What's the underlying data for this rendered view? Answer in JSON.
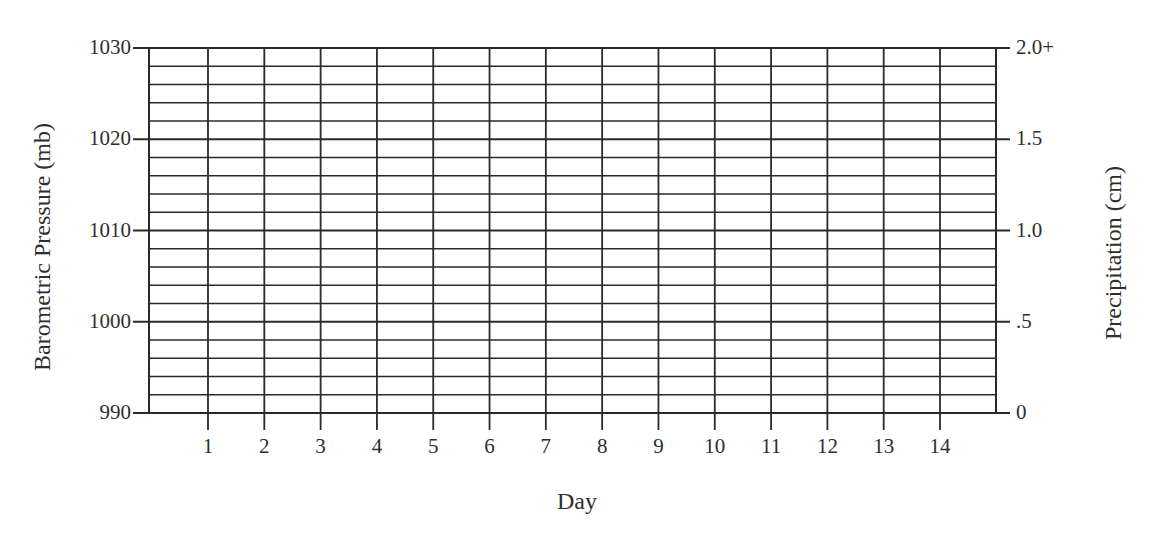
{
  "chart_data": {
    "type": "line",
    "title": "",
    "xlabel": "Day",
    "ylabel": "Barometric Pressure (mb)",
    "y2label": "Precipitation (cm)",
    "x": [
      1,
      2,
      3,
      4,
      5,
      6,
      7,
      8,
      9,
      10,
      11,
      12,
      13,
      14
    ],
    "x_tick_labels": [
      "1",
      "2",
      "3",
      "4",
      "5",
      "6",
      "7",
      "8",
      "9",
      "10",
      "11",
      "12",
      "13",
      "14"
    ],
    "y_ticks": [
      990,
      1000,
      1010,
      1020,
      1030
    ],
    "y_tick_labels": [
      "990",
      "1000",
      "1010",
      "1020",
      "1030"
    ],
    "y2_ticks": [
      0,
      0.5,
      1.0,
      1.5,
      2.0
    ],
    "y2_tick_labels": [
      "0",
      ".5",
      "1.0",
      "1.5",
      "2.0+"
    ],
    "ylim": [
      990,
      1030
    ],
    "y2lim": [
      0,
      2.0
    ],
    "minor_gridline_step_mb": 2,
    "grid": true,
    "series": [],
    "note": "Blank data graph grid — no data points plotted"
  },
  "labels": {
    "y_left": "Barometric Pressure (mb)",
    "y_right": "Precipitation (cm)",
    "x": "Day"
  },
  "colors": {
    "grid_line": "#2a2a2a",
    "text": "#2e2e2e",
    "background": "#ffffff"
  }
}
